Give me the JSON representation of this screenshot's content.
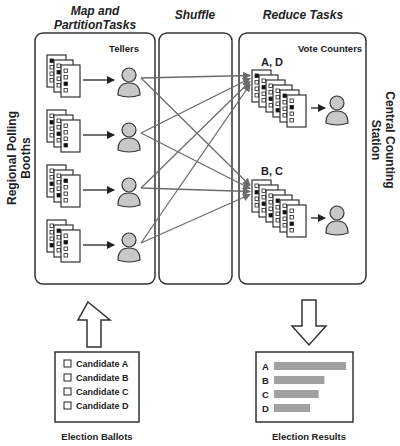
{
  "headers": {
    "map": [
      "Map and",
      "PartitionTasks"
    ],
    "shuffle": "Shuffle",
    "reduce": "Reduce Tasks"
  },
  "side_labels": {
    "left": [
      "Regional Polling",
      "Booths"
    ],
    "right": [
      "Central Counting",
      "Station"
    ]
  },
  "map_box": {
    "role_label": "Tellers",
    "teller_count": 4
  },
  "reduce_box": {
    "role_label": "Vote Counters",
    "groups": [
      {
        "label": "A, D"
      },
      {
        "label": "B, C"
      }
    ]
  },
  "ballots": {
    "caption": "Election Ballots",
    "options": [
      "Candidate A",
      "Candidate B",
      "Candidate C",
      "Candidate D"
    ]
  },
  "results": {
    "caption": "Election Results",
    "bars": [
      {
        "label": "A",
        "value": 1.0
      },
      {
        "label": "B",
        "value": 0.7
      },
      {
        "label": "C",
        "value": 0.62
      },
      {
        "label": "D",
        "value": 0.5
      }
    ]
  },
  "colors": {
    "stroke": "#333333",
    "arrow_gray": "#6b6b6b",
    "person_fill": "#c8c8c8",
    "bar_fill": "#a0a0a0"
  }
}
